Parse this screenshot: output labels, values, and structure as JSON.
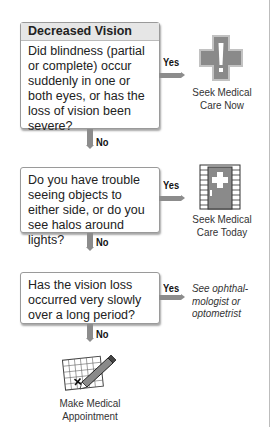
{
  "title": "Decreased Vision",
  "colors": {
    "arrow": "#8c8c8c",
    "box_border": "#9a9a9a",
    "header_bg": "#e6e6e6",
    "icon_gray": "#8a8a8a"
  },
  "nodes": [
    {
      "question": "Did blindness (partial or complete) occur suddenly in one or both eyes, or has the loss of vision been severe?",
      "yes_label": "Yes",
      "no_label": "No",
      "yes_outcome": {
        "icon": "medical-cross-icon",
        "text_line1": "Seek Medical",
        "text_line2": "Care Now"
      }
    },
    {
      "question": "Do you have trouble seeing objects to either side, or do you see halos around lights?",
      "yes_label": "Yes",
      "no_label": "No",
      "yes_outcome": {
        "icon": "clinic-door-icon",
        "text_line1": "Seek Medical",
        "text_line2": "Care Today"
      }
    },
    {
      "question": "Has the vision loss occurred very slowly over a long period?",
      "yes_label": "Yes",
      "no_label": "No",
      "yes_outcome": {
        "text_line1": "See ophthal-",
        "text_line2": "mologist or",
        "text_line3": "optometrist"
      }
    }
  ],
  "final_outcome": {
    "icon": "calendar-pencil-icon",
    "text_line1": "Make Medical",
    "text_line2": "Appointment"
  }
}
